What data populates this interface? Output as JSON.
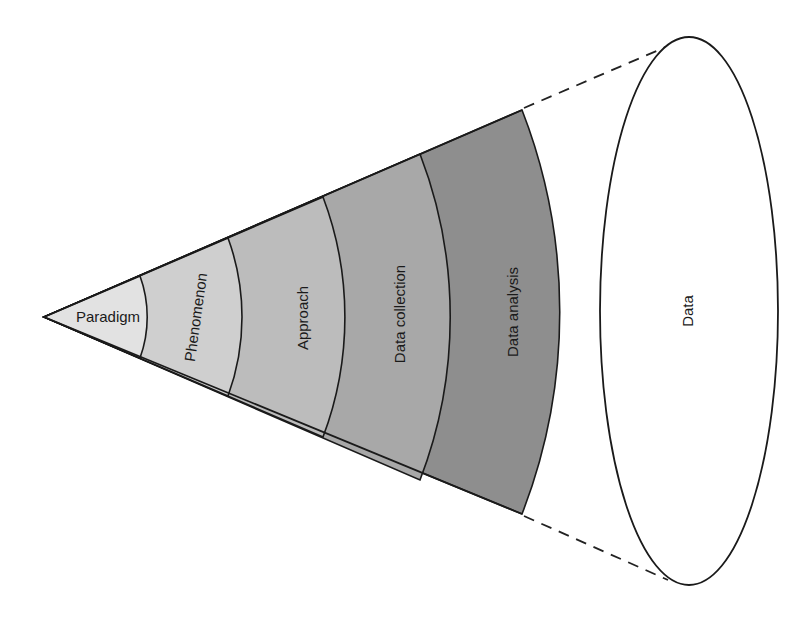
{
  "diagram": {
    "title": "",
    "layers": [
      {
        "label": "Paradigm",
        "fill": "#e2e2e2"
      },
      {
        "label": "Phenomenon",
        "fill": "#cfcfcf"
      },
      {
        "label": "Approach",
        "fill": "#bcbcbc"
      },
      {
        "label": "Data collection",
        "fill": "#a8a8a8"
      },
      {
        "label": "Data analysis",
        "fill": "#8e8e8e"
      }
    ],
    "target": {
      "label": "Data",
      "fill": "#ffffff"
    },
    "connector_style": "dashed"
  }
}
